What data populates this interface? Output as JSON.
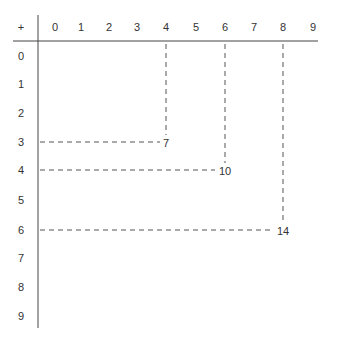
{
  "table": {
    "operator": "+",
    "columns": [
      "0",
      "1",
      "2",
      "3",
      "4",
      "5",
      "6",
      "7",
      "8",
      "9"
    ],
    "rows": [
      "0",
      "1",
      "2",
      "3",
      "4",
      "5",
      "6",
      "7",
      "8",
      "9"
    ]
  },
  "highlights": [
    {
      "row": 3,
      "col": 4,
      "sum": "7"
    },
    {
      "row": 4,
      "col": 6,
      "sum": "10"
    },
    {
      "row": 6,
      "col": 8,
      "sum": "14"
    }
  ],
  "colors": {
    "line": "#444444",
    "dash": "#555555",
    "text": "#333333"
  }
}
